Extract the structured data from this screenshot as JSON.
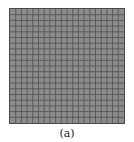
{
  "figure": {
    "caption": "(a)",
    "mesh": {
      "rows": 20,
      "cols": 20,
      "fill_color": "#8c8c8c",
      "line_color": "#4f4f4f"
    }
  }
}
